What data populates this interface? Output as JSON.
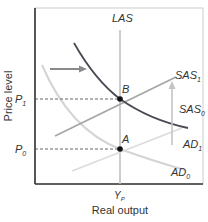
{
  "diagram": {
    "title": "",
    "x_axis_label": "Real output",
    "y_axis_label": "Price level",
    "x_tick_label": "Y",
    "x_tick_sub": "P",
    "y_ticks": [
      {
        "label": "P",
        "sub": "1"
      },
      {
        "label": "P",
        "sub": "0"
      }
    ],
    "curves": {
      "las": {
        "label": "LAS"
      },
      "sas1": {
        "label": "SAS",
        "sub": "1"
      },
      "sas0": {
        "label": "SAS",
        "sub": "0"
      },
      "ad1": {
        "label": "AD",
        "sub": "1"
      },
      "ad0": {
        "label": "AD",
        "sub": "0"
      }
    },
    "points": {
      "a": {
        "label": "A"
      },
      "b": {
        "label": "B"
      }
    },
    "colors": {
      "frame": "#cccccc",
      "axis": "#333333",
      "ad1": "#4a4a55",
      "ad0": "#d4d4d4",
      "sas1": "#a6a6a6",
      "sas0": "#dcdcdc",
      "las": "#bdbdbd",
      "arrow": "#8a8a8a",
      "dashed": "#555555",
      "point": "#111111"
    }
  }
}
